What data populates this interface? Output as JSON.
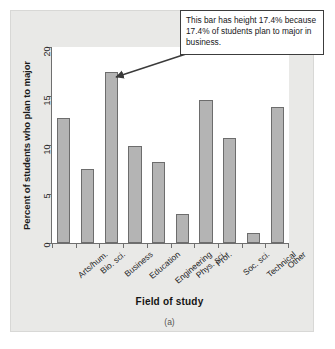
{
  "chart_data": {
    "type": "bar",
    "title": "",
    "subtitle": "",
    "xlabel": "Field of study",
    "ylabel": "Percent of students who plan to major",
    "ylim": [
      0,
      20
    ],
    "yticks": [
      0,
      5,
      10,
      15,
      20
    ],
    "ytick_labels": [
      "0",
      "5",
      "10",
      "15",
      "20"
    ],
    "grid": false,
    "legend": null,
    "bar_color": "#b4b4b4",
    "bar_edge_color": "#6d6d6d",
    "categories": [
      "Arts/hum.",
      "Bio. sci.",
      "Business",
      "Education",
      "Engineering",
      "Phys. sci.",
      "Prof.",
      "Soc. sci.",
      "Technical",
      "Other"
    ],
    "values": [
      12.8,
      7.6,
      17.4,
      9.9,
      8.3,
      3.0,
      14.6,
      10.7,
      1.0,
      13.9
    ],
    "annotations": [
      {
        "text": "This bar has height 17.4% because 17.4% of students plan to major in business.",
        "points_to_category": "Business",
        "points_to_value": 17.4
      }
    ],
    "caption": "(a)"
  },
  "figure": {
    "caption": "(a)",
    "x_axis_title": "Field of study",
    "y_axis_title": "Percent of students who plan to major"
  },
  "callout": {
    "text": "This bar has height 17.4% because 17.4% of students plan to major in business."
  }
}
